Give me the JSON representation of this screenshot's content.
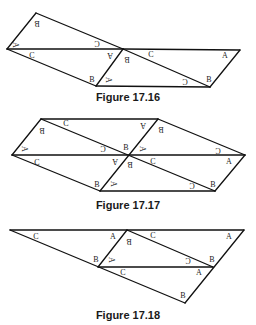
{
  "figures": [
    {
      "caption": "Figure 17.16",
      "caption_y": 91,
      "edges": [
        [
          36,
          13,
          7,
          49
        ],
        [
          36,
          13,
          123,
          49
        ],
        [
          7,
          49,
          123,
          49
        ],
        [
          7,
          49,
          96,
          86
        ],
        [
          123,
          49,
          96,
          86
        ],
        [
          96,
          86,
          210,
          87
        ],
        [
          123,
          49,
          240,
          50
        ],
        [
          240,
          50,
          210,
          87
        ],
        [
          123,
          49,
          210,
          87
        ]
      ],
      "labels": [
        {
          "t": "B",
          "x": 37,
          "y": 23,
          "r": 180
        },
        {
          "t": "A",
          "x": 15,
          "y": 45,
          "r": 90
        },
        {
          "t": "C",
          "x": 97,
          "y": 43,
          "r": 180
        },
        {
          "t": "C",
          "x": 32,
          "y": 55,
          "r": 0
        },
        {
          "t": "A",
          "x": 110,
          "y": 55,
          "r": 180
        },
        {
          "t": "B",
          "x": 92,
          "y": 79,
          "r": 0
        },
        {
          "t": "B",
          "x": 127,
          "y": 59,
          "r": 180
        },
        {
          "t": "A",
          "x": 108,
          "y": 80,
          "r": 90
        },
        {
          "t": "C",
          "x": 151,
          "y": 54,
          "r": 0
        },
        {
          "t": "A",
          "x": 225,
          "y": 55,
          "r": 0
        },
        {
          "t": "C",
          "x": 185,
          "y": 81,
          "r": 180
        },
        {
          "t": "B",
          "x": 209,
          "y": 79,
          "r": 0
        }
      ]
    },
    {
      "caption": "Figure 17.17",
      "caption_y": 199,
      "edges": [
        [
          41,
          119,
          158,
          119
        ],
        [
          41,
          119,
          12,
          155
        ],
        [
          12,
          155,
          245,
          155
        ],
        [
          41,
          119,
          215,
          191
        ],
        [
          158,
          119,
          100,
          191
        ],
        [
          158,
          119,
          245,
          155
        ],
        [
          12,
          155,
          100,
          191
        ],
        [
          100,
          191,
          215,
          191
        ],
        [
          245,
          155,
          215,
          191
        ]
      ],
      "labels": [
        {
          "t": "C",
          "x": 66,
          "y": 123,
          "r": 0
        },
        {
          "t": "B",
          "x": 42,
          "y": 130,
          "r": 180
        },
        {
          "t": "A",
          "x": 143,
          "y": 125,
          "r": 180
        },
        {
          "t": "B",
          "x": 161,
          "y": 129,
          "r": 180
        },
        {
          "t": "A",
          "x": 24,
          "y": 149,
          "r": 90
        },
        {
          "t": "C",
          "x": 103,
          "y": 148,
          "r": 180
        },
        {
          "t": "B",
          "x": 126,
          "y": 147,
          "r": 0
        },
        {
          "t": "A",
          "x": 142,
          "y": 149,
          "r": 90
        },
        {
          "t": "C",
          "x": 218,
          "y": 150,
          "r": 180
        },
        {
          "t": "C",
          "x": 37,
          "y": 162,
          "r": 0
        },
        {
          "t": "A",
          "x": 115,
          "y": 161,
          "r": 180
        },
        {
          "t": "B",
          "x": 130,
          "y": 164,
          "r": 180
        },
        {
          "t": "C",
          "x": 153,
          "y": 161,
          "r": 0
        },
        {
          "t": "A",
          "x": 229,
          "y": 161,
          "r": 0
        },
        {
          "t": "B",
          "x": 97,
          "y": 184,
          "r": 0
        },
        {
          "t": "A",
          "x": 113,
          "y": 184,
          "r": 90
        },
        {
          "t": "C",
          "x": 192,
          "y": 185,
          "r": 180
        },
        {
          "t": "B",
          "x": 213,
          "y": 184,
          "r": 0
        }
      ]
    },
    {
      "caption": "Figure 17.18",
      "caption_y": 309,
      "edges": [
        [
          10,
          230,
          244,
          230
        ],
        [
          10,
          230,
          185,
          303
        ],
        [
          127,
          230,
          98,
          267
        ],
        [
          127,
          230,
          213,
          267
        ],
        [
          98,
          267,
          213,
          267
        ],
        [
          244,
          230,
          185,
          303
        ]
      ],
      "labels": [
        {
          "t": "C",
          "x": 36,
          "y": 236,
          "r": 0
        },
        {
          "t": "A",
          "x": 113,
          "y": 236,
          "r": 0
        },
        {
          "t": "B",
          "x": 129,
          "y": 241,
          "r": 180
        },
        {
          "t": "C",
          "x": 153,
          "y": 235,
          "r": 0
        },
        {
          "t": "A",
          "x": 229,
          "y": 236,
          "r": 0
        },
        {
          "t": "B",
          "x": 96,
          "y": 259,
          "r": 0
        },
        {
          "t": "A",
          "x": 111,
          "y": 260,
          "r": 90
        },
        {
          "t": "C",
          "x": 188,
          "y": 260,
          "r": 180
        },
        {
          "t": "B",
          "x": 212,
          "y": 259,
          "r": 0
        },
        {
          "t": "C",
          "x": 123,
          "y": 272,
          "r": 0
        },
        {
          "t": "A",
          "x": 199,
          "y": 272,
          "r": 0
        },
        {
          "t": "B",
          "x": 183,
          "y": 295,
          "r": 0
        }
      ]
    }
  ],
  "colors": {
    "line": "#111111",
    "label": "#222222",
    "background": "#ffffff"
  }
}
